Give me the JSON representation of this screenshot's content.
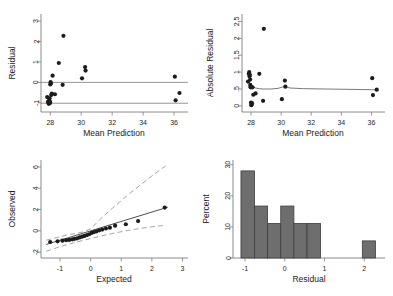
{
  "figure": {
    "name": "regression-diagnostics-panel",
    "background": "#ffffff",
    "point_color": "#1c1c1c",
    "bar_color": "#6e6e6e",
    "bar_edge_color": "#3d3d3d",
    "axis_color": "#7d7d7d",
    "line_color": "#6a6a6a"
  },
  "chart_data": [
    {
      "id": "residual-vs-prediction",
      "type": "scatter",
      "title": "",
      "xlabel": "Mean Prediction",
      "ylabel": "Residual",
      "xlim": [
        27.4,
        36.9
      ],
      "ylim": [
        -1.45,
        3.35
      ],
      "xticks": [
        28,
        30,
        32,
        34,
        36
      ],
      "xticklabels": [
        "28",
        "30",
        "32",
        "34",
        "36"
      ],
      "yticks": [
        -1,
        0,
        1,
        2,
        3
      ],
      "yticklabels": [
        "-1",
        "0",
        "1",
        "2",
        "3"
      ],
      "grid": false,
      "legend": "none",
      "reference_lines": [
        {
          "name": "zero-line",
          "y": 0
        },
        {
          "name": "lower-bound-line",
          "y": -1.02
        }
      ],
      "x": [
        27.8,
        27.85,
        27.88,
        27.9,
        27.92,
        27.94,
        27.95,
        27.97,
        27.99,
        28.0,
        28.02,
        28.04,
        28.06,
        28.1,
        28.15,
        28.3,
        28.55,
        28.8,
        28.85,
        30.05,
        30.25,
        30.28,
        36.05,
        36.1,
        36.35
      ],
      "y": [
        -0.72,
        -0.95,
        -1.0,
        -1.05,
        -0.92,
        -0.88,
        -0.78,
        -1.02,
        -0.98,
        -0.1,
        0.02,
        -0.05,
        -0.62,
        -0.55,
        0.33,
        -0.58,
        0.95,
        -0.12,
        2.28,
        0.2,
        0.75,
        0.58,
        0.28,
        -0.88,
        -0.52
      ]
    },
    {
      "id": "absolute-residual-vs-prediction",
      "type": "scatter",
      "title": "",
      "xlabel": "Mean Prediction",
      "ylabel": "Absolute Residual",
      "xlim": [
        27.4,
        36.9
      ],
      "ylim": [
        -0.18,
        2.72
      ],
      "xticks": [
        28,
        30,
        32,
        34,
        36
      ],
      "xticklabels": [
        "28",
        "30",
        "32",
        "34",
        "36"
      ],
      "yticks": [
        0,
        0.5,
        1,
        1.5,
        2,
        2.5
      ],
      "yticklabels": [
        "0",
        ".5",
        "1",
        "1.5",
        "2",
        "2.5"
      ],
      "grid": false,
      "legend": "none",
      "x": [
        27.8,
        27.85,
        27.88,
        27.9,
        27.92,
        27.94,
        27.95,
        27.97,
        27.99,
        28.0,
        28.02,
        28.04,
        28.06,
        28.1,
        28.15,
        28.3,
        28.55,
        28.8,
        28.85,
        30.05,
        30.25,
        30.28,
        36.05,
        36.1,
        36.35
      ],
      "y": [
        0.72,
        0.95,
        1.0,
        0.88,
        0.92,
        0.78,
        0.62,
        0.55,
        0.58,
        0.1,
        0.02,
        0.05,
        0.08,
        0.55,
        0.33,
        0.37,
        0.95,
        0.15,
        2.28,
        0.2,
        0.75,
        0.57,
        0.82,
        0.32,
        0.48
      ],
      "smooth_curve": {
        "name": "lowess-curve",
        "x": [
          27.78,
          27.86,
          27.94,
          28.0,
          28.06,
          28.14,
          28.3,
          28.55,
          28.85,
          29.3,
          29.8,
          30.1,
          30.25,
          30.6,
          31.5,
          33.0,
          34.5,
          36.0,
          36.45
        ],
        "y": [
          0.76,
          0.72,
          0.6,
          0.5,
          0.54,
          0.56,
          0.53,
          0.51,
          0.5,
          0.5,
          0.52,
          0.56,
          0.57,
          0.53,
          0.51,
          0.5,
          0.49,
          0.48,
          0.47
        ]
      }
    },
    {
      "id": "normal-quantile-plot",
      "type": "scatter",
      "title": "",
      "xlabel": "Expected",
      "ylabel": "Observed",
      "xlim": [
        -1.62,
        3.18
      ],
      "ylim": [
        -2.55,
        6.65
      ],
      "xticks": [
        -1,
        0,
        1,
        2,
        3
      ],
      "xticklabels": [
        "-1",
        "0",
        "1",
        "2",
        "3"
      ],
      "yticks": [
        -2,
        0,
        2,
        4,
        6
      ],
      "yticklabels": [
        "-2",
        "0",
        "2",
        "4",
        "6"
      ],
      "grid": false,
      "legend": "none",
      "x": [
        -1.32,
        -1.08,
        -0.92,
        -0.8,
        -0.7,
        -0.6,
        -0.52,
        -0.44,
        -0.36,
        -0.28,
        -0.2,
        -0.12,
        -0.05,
        0.03,
        0.11,
        0.19,
        0.28,
        0.38,
        0.5,
        0.63,
        0.8,
        1.15,
        1.55,
        2.42
      ],
      "y": [
        -1.05,
        -0.98,
        -0.92,
        -0.88,
        -0.85,
        -0.8,
        -0.75,
        -0.7,
        -0.62,
        -0.55,
        -0.48,
        -0.4,
        -0.32,
        -0.2,
        -0.12,
        -0.05,
        0.05,
        0.12,
        0.22,
        0.3,
        0.48,
        0.62,
        0.92,
        2.18
      ],
      "fit_line": {
        "name": "reference-fit-line",
        "x": [
          -1.45,
          2.52
        ],
        "y": [
          -1.28,
          2.22
        ]
      },
      "confidence_bands": [
        {
          "name": "upper-confidence-band",
          "x": [
            -1.45,
            -1.1,
            -0.8,
            -0.5,
            -0.25,
            0.0,
            0.3,
            0.6,
            0.9,
            1.25,
            1.6,
            2.0,
            2.45
          ],
          "y": [
            -0.88,
            -0.62,
            -0.42,
            -0.25,
            -0.1,
            0.18,
            1.05,
            1.85,
            2.58,
            3.45,
            4.25,
            5.15,
            6.1
          ]
        },
        {
          "name": "lower-confidence-band",
          "x": [
            -1.45,
            -1.1,
            -0.8,
            -0.5,
            -0.25,
            0.0,
            0.3,
            0.6,
            0.9,
            1.25,
            1.6,
            2.0,
            2.45
          ],
          "y": [
            -1.92,
            -1.58,
            -1.32,
            -1.08,
            -0.9,
            -0.72,
            -0.52,
            -0.32,
            -0.14,
            0.05,
            0.22,
            0.38,
            0.52
          ]
        }
      ]
    },
    {
      "id": "residual-histogram",
      "type": "bar",
      "title": "",
      "xlabel": "Residual",
      "ylabel": "Percent",
      "xlim": [
        -1.3,
        2.52
      ],
      "ylim": [
        0,
        31.5
      ],
      "xticks": [
        -1,
        0,
        1,
        2
      ],
      "xticklabels": [
        "-1",
        "0",
        "1",
        "2"
      ],
      "yticks": [
        0,
        10,
        20,
        30
      ],
      "yticklabels": [
        "0",
        "10",
        "20",
        "30"
      ],
      "grid": false,
      "legend": "none",
      "bin_edges": [
        -1.1,
        -0.76,
        -0.43,
        -0.1,
        0.23,
        0.56,
        0.9,
        1.95,
        2.28
      ],
      "bins": [
        {
          "left": -1.1,
          "right": -0.76,
          "value": 28.0
        },
        {
          "left": -0.76,
          "right": -0.43,
          "value": 16.7
        },
        {
          "left": -0.43,
          "right": -0.1,
          "value": 11.1
        },
        {
          "left": -0.1,
          "right": 0.23,
          "value": 16.7
        },
        {
          "left": 0.23,
          "right": 0.56,
          "value": 11.1
        },
        {
          "left": 0.56,
          "right": 0.9,
          "value": 11.1
        },
        {
          "left": 1.95,
          "right": 2.28,
          "value": 5.5
        }
      ],
      "categories": [
        "-1.10 to -0.76",
        "-0.76 to -0.43",
        "-0.43 to -0.10",
        "-0.10 to 0.23",
        "0.23 to 0.56",
        "0.56 to 0.90",
        "1.95 to 2.28"
      ],
      "values": [
        28.0,
        16.7,
        11.1,
        16.7,
        11.1,
        11.1,
        5.5
      ]
    }
  ]
}
